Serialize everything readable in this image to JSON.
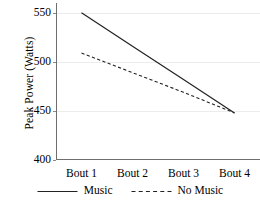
{
  "chart_data": {
    "type": "line",
    "title": "",
    "xlabel": "",
    "ylabel": "Peak Power (Watts)",
    "categories": [
      "Bout 1",
      "Bout 2",
      "Bout 3",
      "Bout 4"
    ],
    "yticks": [
      400,
      450,
      500,
      550
    ],
    "ytick_labels": [
      "400",
      "450",
      "500",
      "550"
    ],
    "ylim": [
      400,
      560
    ],
    "grid": "horizontal",
    "legend_position": "bottom",
    "series": [
      {
        "name": "Music",
        "style": "solid",
        "color": "#222222",
        "values": [
          550,
          516,
          482,
          448
        ]
      },
      {
        "name": "No Music",
        "style": "dashed",
        "color": "#222222",
        "values": [
          509,
          489,
          469,
          448
        ]
      }
    ]
  },
  "legend": {
    "items": [
      {
        "label": "Music",
        "style": "solid"
      },
      {
        "label": "No Music",
        "style": "dashed"
      }
    ]
  },
  "axis": {
    "line_color": "#6e6e6e",
    "grid_color": "#ececec"
  }
}
